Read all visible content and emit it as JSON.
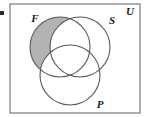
{
  "figure": {
    "type": "venn-diagram-3-set",
    "caption_bullet": "·",
    "universe": {
      "label": "U",
      "label_x": 130,
      "label_y": 15,
      "frame": {
        "x": 10,
        "y": 4,
        "width": 130,
        "height": 109
      },
      "border_color": "#7a7a7a",
      "border_width": 1.2,
      "fill_color": "#ffffff"
    },
    "circles": [
      {
        "name": "F",
        "label": "F",
        "cx": 60,
        "cy": 47,
        "r": 30,
        "label_x": 35,
        "label_y": 22,
        "stroke_color": "#5a5a5a",
        "stroke_width": 1.1,
        "shaded": true
      },
      {
        "name": "S",
        "label": "S",
        "cx": 80,
        "cy": 47,
        "r": 30,
        "label_x": 112,
        "label_y": 24,
        "stroke_color": "#5a5a5a",
        "stroke_width": 1.1,
        "shaded": false
      },
      {
        "name": "P",
        "label": "P",
        "cx": 70,
        "cy": 75,
        "r": 30,
        "label_x": 100,
        "label_y": 108,
        "stroke_color": "#5a5a5a",
        "stroke_width": 1.1,
        "shaded": false
      }
    ],
    "shaded_region": {
      "description": "F only (F minus S minus P)",
      "fill_color": "#b3b3b3",
      "set_expression": "F ∩ S' ∩ P'"
    },
    "bullet_mark": {
      "x": 0,
      "y": 11,
      "width": 4,
      "height": 4,
      "color": "#2b2b2b"
    }
  }
}
